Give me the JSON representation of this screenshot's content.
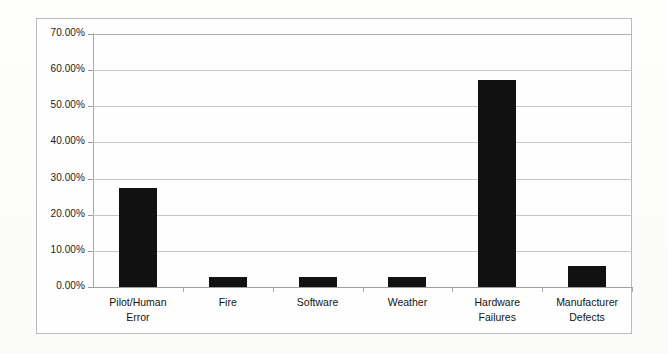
{
  "chart_data": {
    "type": "bar",
    "title": "",
    "subtitle": "",
    "xlabel": "",
    "ylabel": "",
    "categories": [
      "Pilot/Human\nError",
      "Fire",
      "Software",
      "Weather",
      "Hardware\nFailures",
      "Manufacturer\nDefects"
    ],
    "values": [
      27.5,
      2.8,
      2.8,
      2.8,
      57.4,
      5.7
    ],
    "value_labels": [
      "27.50%",
      "2.80%",
      "2.80%",
      "2.80%",
      "57.40%",
      "5.70%"
    ],
    "ylim": [
      0,
      70
    ],
    "ytick_values": [
      0,
      10,
      20,
      30,
      40,
      50,
      60,
      70
    ],
    "ytick_labels": [
      "0.00%",
      "10.00%",
      "20.00%",
      "30.00%",
      "40.00%",
      "50.00%",
      "60.00%",
      "70.00%"
    ],
    "grid": true,
    "legend": false,
    "legend_position": "none",
    "bar_color": "#111111",
    "gridline_color": "#c6c6c6",
    "axis_color": "#a8a8a8",
    "plot_background": "#fefefe",
    "border_color": "#b9b9b9"
  }
}
